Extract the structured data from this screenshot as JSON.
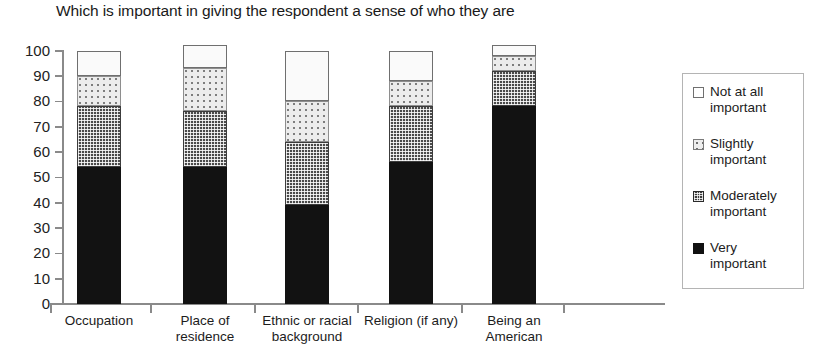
{
  "chart_data": {
    "type": "bar",
    "subtype": "stacked-column-100",
    "title": "Which is important in giving the respondent a sense of who they are",
    "xlabel": "",
    "ylabel": "",
    "ylim": [
      0,
      100
    ],
    "yticks": [
      0,
      10,
      20,
      30,
      40,
      50,
      60,
      70,
      80,
      90,
      100
    ],
    "grid": false,
    "legend_position": "right",
    "categories": [
      "Occupation",
      "Place of residence",
      "Ethnic or racial background",
      "Religion (if any)",
      "Being an American"
    ],
    "category_lines": [
      [
        "Occupation"
      ],
      [
        "Place of",
        "residence"
      ],
      [
        "Ethnic or racial",
        "background"
      ],
      [
        "Religion (if any)"
      ],
      [
        "Being an",
        "American"
      ]
    ],
    "series": [
      {
        "name": "Very important",
        "values": [
          54,
          54,
          39,
          56,
          78
        ]
      },
      {
        "name": "Moderately important",
        "values": [
          24,
          22,
          25,
          22,
          14
        ]
      },
      {
        "name": "Slightly important",
        "values": [
          12,
          17,
          16,
          10,
          6
        ]
      },
      {
        "name": "Not at all important",
        "values": [
          10,
          9,
          20,
          12,
          4
        ]
      }
    ],
    "stack_order_bottom_to_top": [
      "Very important",
      "Moderately important",
      "Slightly important",
      "Not at all important"
    ],
    "colors": {
      "very_important": "#121212",
      "moderately_important": "#4a4a4a",
      "slightly_important": "#ececec",
      "not_at_all_important": "#fafafa",
      "axis": "#8a8a8a"
    }
  },
  "legend": {
    "items": [
      {
        "label_line1": "Not at all",
        "label_line2": "important",
        "pattern": "white"
      },
      {
        "label_line1": "Slightly",
        "label_line2": "important",
        "pattern": "dotted"
      },
      {
        "label_line1": "Moderately",
        "label_line2": "important",
        "pattern": "checkered"
      },
      {
        "label_line1": "Very",
        "label_line2": "important",
        "pattern": "solid-black"
      }
    ]
  },
  "axis": {
    "y_tick_labels": [
      "100",
      "90",
      "80",
      "70",
      "60",
      "50",
      "40",
      "30",
      "20",
      "10",
      "0"
    ]
  }
}
